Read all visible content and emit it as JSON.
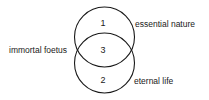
{
  "diagram": {
    "type": "venn",
    "circles": [
      {
        "id": "top",
        "cx": 104.5,
        "cy": 37,
        "r": 30
      },
      {
        "id": "bottom",
        "cx": 104.5,
        "cy": 63,
        "r": 30
      }
    ],
    "regions": {
      "top_only": "1",
      "bottom_only": "2",
      "overlap": "3"
    },
    "labels": {
      "top": "essential nature",
      "overlap": "immortal foetus",
      "bottom": "eternal life"
    },
    "stroke_color": "#1a1a1a"
  }
}
